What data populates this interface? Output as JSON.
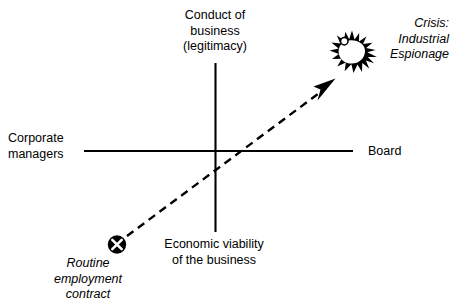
{
  "diagram": {
    "background_color": "#ffffff",
    "stroke_color": "#000000",
    "axes": {
      "vertical": {
        "top_label": "Conduct of\nbusiness\n(legitimacy)",
        "bottom_label": "Economic viability\nof the business"
      },
      "horizontal": {
        "left_label": "Corporate\nmanagers",
        "right_label": "Board"
      }
    },
    "markers": {
      "start": {
        "icon_name": "circled-x-marker",
        "label": "Routine\nemployment\ncontract",
        "style": "italic"
      },
      "end": {
        "icon_name": "explosion-burst-icon",
        "label": "Crisis:\nIndustrial\nEspionage",
        "style": "italic"
      }
    },
    "connector": {
      "icon_name": "dashed-arrow",
      "from": "Routine employment contract",
      "to": "Crisis: Industrial Espionage",
      "line_style": "dashed",
      "arrowhead": "filled-triangle"
    }
  }
}
